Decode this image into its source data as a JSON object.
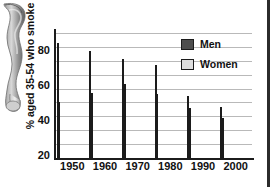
{
  "chart_data": {
    "type": "bar",
    "title": "",
    "xlabel": "",
    "ylabel": "% aged 35-54 who smoke",
    "categories": [
      "1950",
      "1960",
      "1970",
      "1980",
      "1990",
      "2000"
    ],
    "series": [
      {
        "name": "Men",
        "color": "#4d4d4d",
        "values": [
          83,
          77,
          71,
          67,
          45,
          37
        ]
      },
      {
        "name": "Women",
        "color": "#d5d5d5",
        "values": [
          40,
          47,
          53,
          46,
          36,
          29
        ]
      }
    ],
    "ylim": [
      0,
      90
    ],
    "yticks": [
      20,
      40,
      60,
      80
    ],
    "ytick_labels": [
      "20",
      "40",
      "60",
      "80"
    ],
    "gridlines": [
      10,
      20,
      30,
      40,
      50,
      60,
      70,
      80,
      90
    ],
    "grid": true,
    "legend_position": "top-right"
  },
  "legend": {
    "items": [
      {
        "label": "Men"
      },
      {
        "label": "Women"
      }
    ]
  },
  "illustration": {
    "name": "leg-bone-anatomy-illustration"
  },
  "colors": {
    "men": "#4d4d4d",
    "women": "#d5d5d5",
    "axis": "#1c1c1c",
    "grid": "#b9b9b9",
    "frame": "#2b2b2b"
  }
}
